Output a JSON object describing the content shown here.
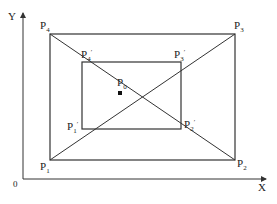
{
  "axes": {
    "x_label": "X",
    "y_label": "Y",
    "origin_label": "0"
  },
  "outer_rect": {
    "p1": {
      "name": "P",
      "sub": "1"
    },
    "p2": {
      "name": "P",
      "sub": "2"
    },
    "p3": {
      "name": "P",
      "sub": "3"
    },
    "p4": {
      "name": "P",
      "sub": "4"
    }
  },
  "inner_rect": {
    "p1": {
      "name": "P",
      "sub": "1",
      "prime": "′"
    },
    "p2": {
      "name": "P",
      "sub": "2",
      "prime": "′"
    },
    "p3": {
      "name": "P",
      "sub": "3",
      "prime": "′"
    },
    "p4": {
      "name": "P",
      "sub": "4",
      "prime": "′"
    }
  },
  "center": {
    "name": "P",
    "sub": "0"
  },
  "colors": {
    "line": "#333333",
    "background": "#ffffff"
  }
}
